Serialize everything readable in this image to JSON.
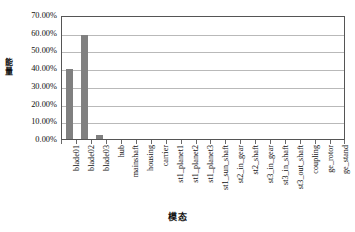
{
  "chart_data": {
    "type": "bar",
    "title": "",
    "xlabel": "模态",
    "ylabel": "能量",
    "ylim": [
      0,
      0.7
    ],
    "ytick_labels": [
      "70.00%",
      "60.00%",
      "50.00%",
      "40.00%",
      "30.00%",
      "20.00%",
      "10.00%",
      "0.00%"
    ],
    "ytick_values": [
      0.7,
      0.6,
      0.5,
      0.4,
      0.3,
      0.2,
      0.1,
      0.0
    ],
    "grid": true,
    "legend": "none",
    "bar_color": "#808080",
    "categories": [
      "blade01",
      "blade02",
      "blade03",
      "hub",
      "mainshaft",
      "housing",
      "carrier",
      "st1_planet1",
      "st1_planet2",
      "st1_planet3",
      "st1_sun_shaft",
      "st2_in_gear",
      "st2_shaft",
      "st3_in_gear",
      "st3_in_shaft",
      "st3_out_shaft",
      "coupling",
      "ge_rotor",
      "ge_stand"
    ],
    "values": [
      0.398,
      0.585,
      0.025,
      0.0,
      0.0,
      0.0,
      0.0,
      0.0,
      0.0,
      0.0,
      0.0,
      0.0,
      0.0,
      0.0,
      0.0,
      0.0,
      0.0,
      0.0,
      0.0
    ]
  }
}
